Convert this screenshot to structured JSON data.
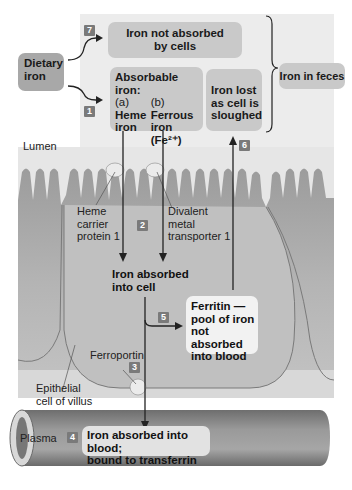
{
  "diagram": {
    "nodes": {
      "dietary_iron": "Dietary iron",
      "not_absorbed": [
        "Iron not absorbed",
        "by cells"
      ],
      "absorbable": {
        "heading": [
          "Absorbable",
          "iron:"
        ],
        "a_label": "(a)",
        "a_text": [
          "Heme",
          "iron"
        ],
        "b_label": "(b)",
        "b_text": [
          "Ferrous",
          "iron (Fe²⁺)"
        ]
      },
      "iron_lost": [
        "Iron lost",
        "as cell is",
        "sloughed"
      ],
      "iron_in_feces": "Iron in feces",
      "absorbed_into_cell": [
        "Iron absorbed",
        "into cell"
      ],
      "ferritin": [
        "Ferritin —",
        "pool of iron",
        "not absorbed",
        "into blood"
      ],
      "absorbed_into_blood": [
        "Iron absorbed into blood;",
        "bound to transferrin"
      ]
    },
    "labels": {
      "lumen": "Lumen",
      "heme_carrier": [
        "Heme",
        "carrier",
        "protein 1"
      ],
      "dmt1": [
        "Divalent",
        "metal",
        "transporter 1"
      ],
      "ferroportin": "Ferroportin",
      "epithelial": [
        "Epithelial",
        "cell of villus"
      ],
      "plasma": "Plasma"
    },
    "steps": [
      "1",
      "2",
      "3",
      "4",
      "5",
      "6",
      "7"
    ],
    "colors": {
      "box_fill": "#c9c9c9",
      "panel_fill": "#ececec",
      "cell_fill": "#a9a9a9",
      "vessel_fill": "#8a8a8a",
      "badge_fill": "#7a7a7a"
    }
  }
}
